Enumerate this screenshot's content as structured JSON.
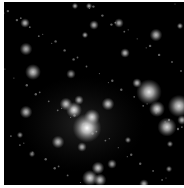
{
  "image": {
    "subject": "galaxy cluster deep-field astronomical photograph",
    "palette": "grayscale",
    "background_color": "#000000",
    "border_color": "#ffffff",
    "diffuse_halo": {
      "cx": 78,
      "cy": 122,
      "rx": 62,
      "ry": 48,
      "opacity": 0.28
    },
    "sources": [
      {
        "x": 83,
        "y": 126,
        "r": 9,
        "b": 1.0
      },
      {
        "x": 70,
        "y": 108,
        "r": 5,
        "b": 0.9
      },
      {
        "x": 88,
        "y": 115,
        "r": 5,
        "b": 0.85
      },
      {
        "x": 62,
        "y": 102,
        "r": 4,
        "b": 0.8
      },
      {
        "x": 104,
        "y": 102,
        "r": 4,
        "b": 0.8
      },
      {
        "x": 75,
        "y": 98,
        "r": 3,
        "b": 0.7
      },
      {
        "x": 54,
        "y": 140,
        "r": 4,
        "b": 0.75
      },
      {
        "x": 78,
        "y": 145,
        "r": 3,
        "b": 0.7
      },
      {
        "x": 22,
        "y": 110,
        "r": 4,
        "b": 0.75
      },
      {
        "x": 29,
        "y": 70,
        "r": 5,
        "b": 0.8
      },
      {
        "x": 145,
        "y": 90,
        "r": 8,
        "b": 0.9
      },
      {
        "x": 153,
        "y": 107,
        "r": 5,
        "b": 0.85
      },
      {
        "x": 175,
        "y": 104,
        "r": 7,
        "b": 0.85
      },
      {
        "x": 163,
        "y": 125,
        "r": 6,
        "b": 0.85
      },
      {
        "x": 133,
        "y": 81,
        "r": 3,
        "b": 0.75
      },
      {
        "x": 178,
        "y": 118,
        "r": 3,
        "b": 0.7
      },
      {
        "x": 86,
        "y": 176,
        "r": 5,
        "b": 0.85
      },
      {
        "x": 94,
        "y": 166,
        "r": 4,
        "b": 0.8
      },
      {
        "x": 96,
        "y": 178,
        "r": 4,
        "b": 0.8
      },
      {
        "x": 108,
        "y": 162,
        "r": 3,
        "b": 0.65
      },
      {
        "x": 21,
        "y": 21,
        "r": 3,
        "b": 0.75
      },
      {
        "x": 90,
        "y": 23,
        "r": 3,
        "b": 0.7
      },
      {
        "x": 115,
        "y": 21,
        "r": 3,
        "b": 0.7
      },
      {
        "x": 152,
        "y": 33,
        "r": 4,
        "b": 0.75
      },
      {
        "x": 121,
        "y": 51,
        "r": 3,
        "b": 0.75
      },
      {
        "x": 22,
        "y": 47,
        "r": 4,
        "b": 0.7
      },
      {
        "x": 81,
        "y": 33,
        "r": 2,
        "b": 0.7
      },
      {
        "x": 71,
        "y": 4,
        "r": 2,
        "b": 0.7
      },
      {
        "x": 85,
        "y": 4,
        "r": 2,
        "b": 0.7
      },
      {
        "x": 67,
        "y": 72,
        "r": 3,
        "b": 0.6
      },
      {
        "x": 124,
        "y": 138,
        "r": 2,
        "b": 0.6
      },
      {
        "x": 166,
        "y": 142,
        "r": 2,
        "b": 0.6
      },
      {
        "x": 16,
        "y": 133,
        "r": 2,
        "b": 0.6
      },
      {
        "x": 28,
        "y": 152,
        "r": 2,
        "b": 0.55
      },
      {
        "x": 140,
        "y": 182,
        "r": 3,
        "b": 0.7
      },
      {
        "x": 165,
        "y": 167,
        "r": 2,
        "b": 0.6
      },
      {
        "x": 176,
        "y": 24,
        "r": 2,
        "b": 0.7
      }
    ]
  }
}
